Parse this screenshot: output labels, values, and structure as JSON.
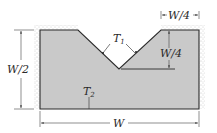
{
  "diagram": {
    "colors": {
      "body_fill": "#c9c9c9",
      "outline": "#2b2b2b",
      "insulation": "#8a8a8a",
      "dimension": "#444444",
      "background": "#ffffff"
    },
    "labels": {
      "t1": "T",
      "t1_sub": "1",
      "t2": "T",
      "t2_sub": "2",
      "height": "W/2",
      "width": "W",
      "notch_width": "W/4",
      "notch_depth": "W/4"
    },
    "surfaces": {
      "notch_surface_temperature": "T1",
      "bottom_surface_temperature": "T2",
      "insulated": [
        "left",
        "top-left",
        "top-right",
        "right"
      ]
    }
  }
}
